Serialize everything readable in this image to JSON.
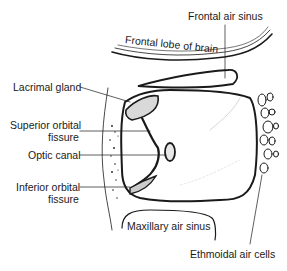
{
  "diagram": {
    "labels": {
      "frontal_air_sinus": "Frontal air sinus",
      "frontal_lobe": "Frontal lobe of brain",
      "lacrimal_gland": "Lacrimal gland",
      "superior_orbital_1": "Superior orbital",
      "superior_orbital_2": "fissure",
      "optic_canal": "Optic canal",
      "inferior_orbital_1": "Inferior orbital",
      "inferior_orbital_2": "fissure",
      "maxillary_air_sinus": "Maxillary air sinus",
      "ethmoidal_air_cells": "Ethmoidal air cells"
    },
    "colors": {
      "ink": "#1a1a1a",
      "background": "#ffffff"
    }
  }
}
